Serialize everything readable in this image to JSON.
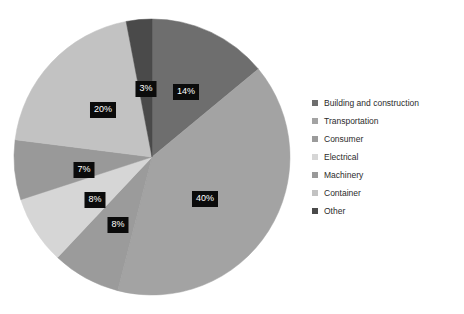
{
  "chart_data": {
    "type": "pie",
    "title": "",
    "subtitle": "",
    "xlabel": "",
    "ylabel": "",
    "legend_position": "right",
    "grid": false,
    "start_angle_deg": 0,
    "direction": "clockwise",
    "categories": [
      "Building and construction",
      "Transportation",
      "Consumer",
      "Electrical",
      "Machinery",
      "Container",
      "Other"
    ],
    "values": [
      14,
      40,
      8,
      8,
      7,
      20,
      3
    ],
    "data_labels": [
      "14%",
      "40%",
      "8%",
      "8%",
      "7%",
      "20%",
      "3%"
    ],
    "colors": [
      "#6e6e6e",
      "#a3a3a3",
      "#9b9b9b",
      "#d6d6d6",
      "#999999",
      "#c2c2c2",
      "#4a4a4a"
    ],
    "slices": [
      {
        "name": "Building and construction",
        "value": 14,
        "label": "14%",
        "color": "#6e6e6e",
        "start_pct": 0,
        "label_x": 186,
        "label_y": 92
      },
      {
        "name": "Transportation",
        "value": 40,
        "label": "40%",
        "color": "#a3a3a3",
        "start_pct": 14,
        "label_x": 205,
        "label_y": 199
      },
      {
        "name": "Consumer",
        "value": 8,
        "label": "8%",
        "color": "#9b9b9b",
        "start_pct": 54,
        "label_x": 118,
        "label_y": 225
      },
      {
        "name": "Electrical",
        "value": 8,
        "label": "8%",
        "color": "#d6d6d6",
        "start_pct": 62,
        "label_x": 95,
        "label_y": 200
      },
      {
        "name": "Machinery",
        "value": 7,
        "label": "7%",
        "color": "#999999",
        "start_pct": 70,
        "label_x": 84,
        "label_y": 170
      },
      {
        "name": "Container",
        "value": 20,
        "label": "20%",
        "color": "#c2c2c2",
        "start_pct": 77,
        "label_x": 103,
        "label_y": 110
      },
      {
        "name": "Other",
        "value": 3,
        "label": "3%",
        "color": "#4a4a4a",
        "start_pct": 97,
        "label_x": 146,
        "label_y": 89
      }
    ]
  },
  "legend": {
    "items": [
      {
        "label": "Building and construction",
        "color": "#6e6e6e"
      },
      {
        "label": "Transportation",
        "color": "#a3a3a3"
      },
      {
        "label": "Consumer",
        "color": "#9b9b9b"
      },
      {
        "label": "Electrical",
        "color": "#d6d6d6"
      },
      {
        "label": "Machinery",
        "color": "#999999"
      },
      {
        "label": "Container",
        "color": "#c2c2c2"
      },
      {
        "label": "Other",
        "color": "#4a4a4a"
      }
    ]
  },
  "geometry": {
    "center_x": 152,
    "center_y": 157,
    "radius": 138
  }
}
